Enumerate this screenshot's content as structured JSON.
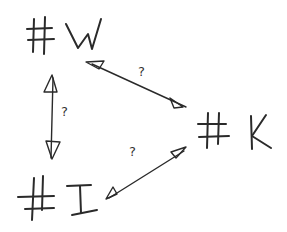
{
  "diagram": {
    "nodes": [
      {
        "id": "W",
        "label": "#W"
      },
      {
        "id": "K",
        "label": "#K"
      },
      {
        "id": "I",
        "label": "#I"
      }
    ],
    "edges": [
      {
        "from": "W",
        "to": "K",
        "label": "?",
        "bidirectional": true
      },
      {
        "from": "W",
        "to": "I",
        "label": "?",
        "bidirectional": true
      },
      {
        "from": "K",
        "to": "I",
        "label": "?",
        "bidirectional": true
      }
    ],
    "stroke_color": "#2a2a2a",
    "background": "#ffffff"
  }
}
